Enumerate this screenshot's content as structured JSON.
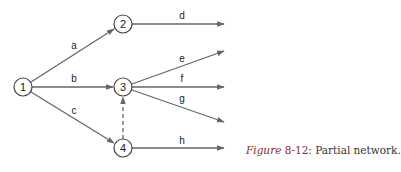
{
  "diagram": {
    "type": "activity-on-arrow network",
    "nodes": [
      {
        "id": "1",
        "label": "1",
        "x": 23,
        "y": 87
      },
      {
        "id": "2",
        "label": "2",
        "x": 123,
        "y": 24
      },
      {
        "id": "3",
        "label": "3",
        "x": 123,
        "y": 87
      },
      {
        "id": "4",
        "label": "4",
        "x": 123,
        "y": 148
      }
    ],
    "edges": [
      {
        "id": "a",
        "label": "a",
        "from": "1",
        "to": "2"
      },
      {
        "id": "b",
        "label": "b",
        "from": "1",
        "to": "3"
      },
      {
        "id": "c",
        "label": "c",
        "from": "1",
        "to": "4"
      },
      {
        "id": "d",
        "label": "d",
        "from": "2",
        "to": null
      },
      {
        "id": "e",
        "label": "e",
        "from": "3",
        "to": null
      },
      {
        "id": "f",
        "label": "f",
        "from": "3",
        "to": null
      },
      {
        "id": "g",
        "label": "g",
        "from": "3",
        "to": null
      },
      {
        "id": "h",
        "label": "h",
        "from": "4",
        "to": null
      },
      {
        "id": "dummy",
        "label": "",
        "from": "4",
        "to": "3",
        "style": "dashed"
      }
    ]
  },
  "caption": {
    "figure_word": "Figure",
    "number": "8-12",
    "text": ": Partial network."
  },
  "colors": {
    "edge": "#666666",
    "node_stroke": "#444444",
    "caption_accent": "#8a2a2a"
  }
}
